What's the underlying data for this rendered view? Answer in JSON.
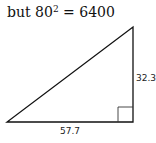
{
  "heading": {
    "prefix": "but 80",
    "exponent": "2",
    "suffix": " = 6400"
  },
  "diagram": {
    "type": "right-triangle",
    "vertical_side_label": "32.3",
    "horizontal_side_label": "57.7",
    "right_angle_marker": true,
    "stroke_color": "#111111"
  }
}
